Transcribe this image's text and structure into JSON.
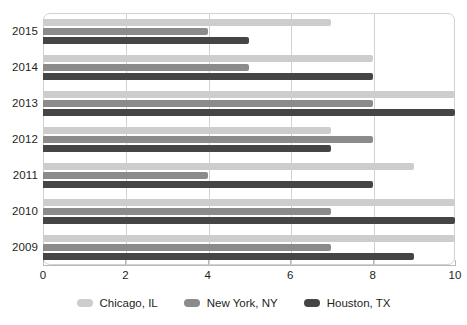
{
  "chart_data": {
    "type": "bar",
    "orientation": "horizontal",
    "title": "",
    "xlabel": "",
    "ylabel": "",
    "xlim": [
      0,
      10
    ],
    "xticks": [
      0,
      2,
      4,
      6,
      8,
      10
    ],
    "xtick_labels": [
      "0",
      "2",
      "4",
      "6",
      "8",
      "10"
    ],
    "grid": true,
    "legend_position": "bottom",
    "categories": [
      "2015",
      "2014",
      "2013",
      "2012",
      "2011",
      "2010",
      "2009"
    ],
    "series": [
      {
        "name": "Chicago, IL",
        "color": "#cdcdcd",
        "values": [
          7,
          8,
          10,
          7,
          9,
          10,
          10
        ]
      },
      {
        "name": "New York, NY",
        "color": "#8b8b8b",
        "values": [
          4,
          5,
          8,
          8,
          4,
          7,
          7
        ]
      },
      {
        "name": "Houston, TX",
        "color": "#454545",
        "values": [
          5,
          8,
          10,
          7,
          8,
          10,
          9
        ]
      }
    ]
  },
  "legend": {
    "items": [
      {
        "label": "Chicago, IL",
        "swatch": "legend-swatch-chicago"
      },
      {
        "label": "New York, NY",
        "swatch": "legend-swatch-new-york"
      },
      {
        "label": "Houston, TX",
        "swatch": "legend-swatch-houston"
      }
    ]
  }
}
